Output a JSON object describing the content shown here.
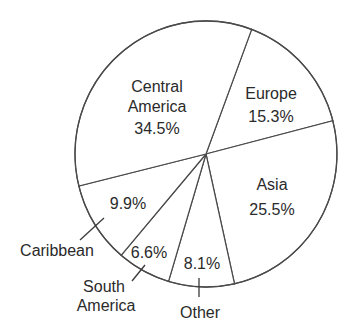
{
  "chart_data": {
    "type": "pie",
    "title": "",
    "categories": [
      "Europe",
      "Asia",
      "Other",
      "South America",
      "Caribbean",
      "Central America"
    ],
    "values": [
      15.3,
      25.5,
      8.1,
      6.6,
      9.9,
      34.5
    ],
    "value_labels": [
      "15.3%",
      "25.5%",
      "8.1%",
      "6.6%",
      "9.9%",
      "34.5%"
    ],
    "unit": "%",
    "start_angle_deg_clockwise_from_top": 20.4,
    "direction": "clockwise",
    "legend": "none (labels on/near slices)",
    "colors": {
      "fill": "#ffffff",
      "stroke": "#4a4a4a",
      "text": "#2a2a2a"
    }
  },
  "labels": {
    "europe": {
      "name": "Europe",
      "value": "15.3%"
    },
    "asia": {
      "name": "Asia",
      "value": "25.5%"
    },
    "other": {
      "name": "Other",
      "value": "8.1%"
    },
    "south_america": {
      "name_line1": "South",
      "name_line2": "America",
      "value": "6.6%"
    },
    "caribbean": {
      "name": "Caribbean",
      "value": "9.9%"
    },
    "central_america": {
      "name_line1": "Central",
      "name_line2": "America",
      "value": "34.5%"
    }
  }
}
